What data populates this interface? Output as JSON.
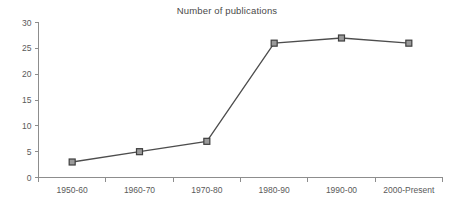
{
  "chart_data": {
    "type": "line",
    "title": "Number of publications",
    "xlabel": "",
    "ylabel": "",
    "categories": [
      "1950-60",
      "1960-70",
      "1970-80",
      "1980-90",
      "1990-00",
      "2000-Present"
    ],
    "values": [
      3,
      5,
      7,
      26,
      27,
      26
    ],
    "series": [
      {
        "name": "Number of publications",
        "values": [
          3,
          5,
          7,
          26,
          27,
          26
        ]
      }
    ],
    "ylim": [
      0,
      30
    ],
    "yticks": [
      0,
      5,
      10,
      15,
      20,
      25,
      30
    ],
    "ytick_labels": [
      "0",
      "5",
      "10",
      "15",
      "20",
      "25",
      "30"
    ],
    "grid": false,
    "legend": false,
    "legend_position": "none",
    "marker": "square",
    "colors": {
      "line": "#4d4d4d",
      "marker_fill": "#9a9a9a",
      "marker_edge": "#3f3f3f",
      "axis": "#8d8d8d",
      "text": "#5a5a5a",
      "title": "#4a4a4a",
      "background": "#ffffff"
    }
  },
  "axes": {
    "y_ticks": [
      {
        "label": "30",
        "value": 30
      },
      {
        "label": "25",
        "value": 25
      },
      {
        "label": "20",
        "value": 20
      },
      {
        "label": "15",
        "value": 15
      },
      {
        "label": "10",
        "value": 10
      },
      {
        "label": "5",
        "value": 5
      },
      {
        "label": "0",
        "value": 0
      }
    ],
    "x_ticks": [
      {
        "label": "1950-60"
      },
      {
        "label": "1960-70"
      },
      {
        "label": "1970-80"
      },
      {
        "label": "1980-90"
      },
      {
        "label": "1990-00"
      },
      {
        "label": "2000-Present"
      }
    ]
  }
}
